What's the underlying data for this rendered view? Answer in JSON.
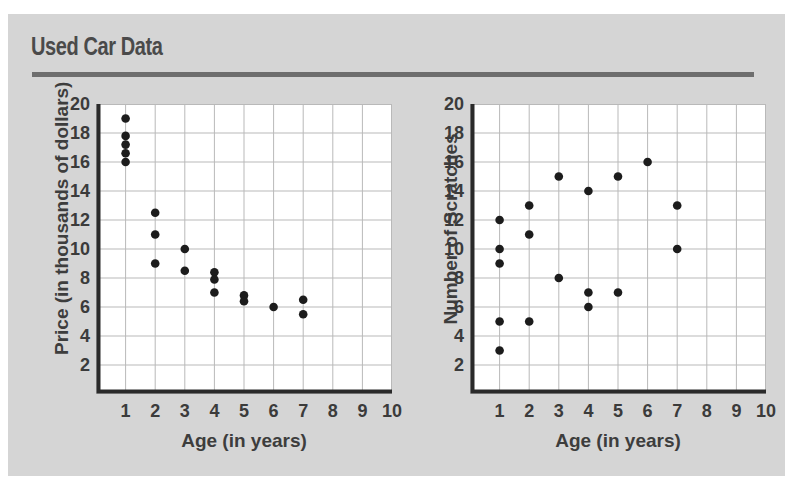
{
  "card": {
    "title": "Used Car Data",
    "background_color": "#d5d5d5",
    "rule_color": "#6e6e6e",
    "title_color": "#4a4a4a"
  },
  "chart_data": [
    {
      "id": "price-vs-age",
      "type": "scatter",
      "title": "",
      "xlabel": "Age (in years)",
      "ylabel": "Price (in thousands of dollars)",
      "xlim": [
        0,
        10
      ],
      "ylim": [
        0,
        20
      ],
      "xticks": [
        1,
        2,
        3,
        4,
        5,
        6,
        7,
        8,
        9,
        10
      ],
      "yticks": [
        2,
        4,
        6,
        8,
        10,
        12,
        14,
        16,
        18,
        20
      ],
      "grid": true,
      "marker_color": "#1c1c1c",
      "points": [
        {
          "x": 1,
          "y": 19.0
        },
        {
          "x": 1,
          "y": 17.8
        },
        {
          "x": 1,
          "y": 17.2
        },
        {
          "x": 1,
          "y": 16.6
        },
        {
          "x": 1,
          "y": 16.0
        },
        {
          "x": 2,
          "y": 12.5
        },
        {
          "x": 2,
          "y": 11.0
        },
        {
          "x": 2,
          "y": 9.0
        },
        {
          "x": 3,
          "y": 10.0
        },
        {
          "x": 3,
          "y": 8.5
        },
        {
          "x": 4,
          "y": 8.4
        },
        {
          "x": 4,
          "y": 7.9
        },
        {
          "x": 4,
          "y": 7.0
        },
        {
          "x": 5,
          "y": 6.8
        },
        {
          "x": 5,
          "y": 6.4
        },
        {
          "x": 6,
          "y": 6.0
        },
        {
          "x": 7,
          "y": 6.5
        },
        {
          "x": 7,
          "y": 5.5
        }
      ]
    },
    {
      "id": "scratches-vs-age",
      "type": "scatter",
      "title": "",
      "xlabel": "Age (in years)",
      "ylabel": "Number of Scratches",
      "xlim": [
        0,
        10
      ],
      "ylim": [
        0,
        20
      ],
      "xticks": [
        1,
        2,
        3,
        4,
        5,
        6,
        7,
        8,
        9,
        10
      ],
      "yticks": [
        2,
        4,
        6,
        8,
        10,
        12,
        14,
        16,
        18,
        20
      ],
      "grid": true,
      "marker_color": "#1c1c1c",
      "points": [
        {
          "x": 1,
          "y": 12
        },
        {
          "x": 1,
          "y": 10
        },
        {
          "x": 1,
          "y": 9
        },
        {
          "x": 1,
          "y": 5
        },
        {
          "x": 1,
          "y": 3
        },
        {
          "x": 2,
          "y": 13
        },
        {
          "x": 2,
          "y": 11
        },
        {
          "x": 2,
          "y": 5
        },
        {
          "x": 3,
          "y": 15
        },
        {
          "x": 3,
          "y": 8
        },
        {
          "x": 4,
          "y": 14
        },
        {
          "x": 4,
          "y": 7
        },
        {
          "x": 4,
          "y": 6
        },
        {
          "x": 5,
          "y": 15
        },
        {
          "x": 5,
          "y": 7
        },
        {
          "x": 6,
          "y": 16
        },
        {
          "x": 7,
          "y": 13
        },
        {
          "x": 7,
          "y": 10
        }
      ]
    }
  ]
}
